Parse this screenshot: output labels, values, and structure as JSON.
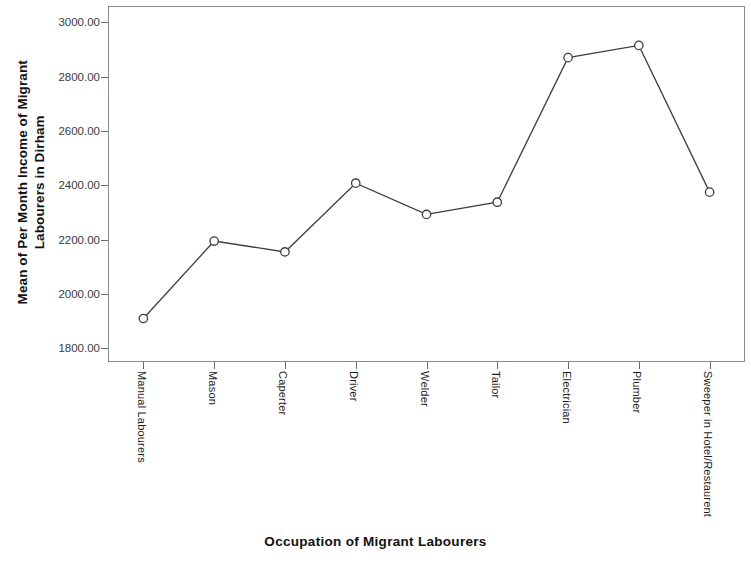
{
  "chart_data": {
    "type": "line",
    "title": "",
    "xlabel": "Occupation of Migrant Labourers",
    "ylabel": "Mean of Per Month Income of Migrant Labourers in Dirham",
    "ylabel_lines": [
      "Mean of Per Month Income of Migrant",
      "Labourers in Dirham"
    ],
    "categories": [
      "Manual Labourers",
      "Mason",
      "Caperter",
      "Driver",
      "Welder",
      "Tailor",
      "Electrician",
      "Plumber",
      "Sweeper in Hotel/Restaurent"
    ],
    "values": [
      1910,
      2195,
      2155,
      2408,
      2293,
      2338,
      2870,
      2915,
      2375
    ],
    "ylim": [
      1750,
      3060
    ],
    "yticks": [
      1800,
      2000,
      2200,
      2400,
      2600,
      2800,
      3000
    ],
    "ytick_labels": [
      "1800.00",
      "2000.00",
      "2200.00",
      "2400.00",
      "2600.00",
      "2800.00",
      "3000.00"
    ],
    "grid": false,
    "legend": false,
    "legend_position": "none",
    "marker": "open-circle",
    "line_color": "#3d3d3d",
    "marker_color": "#3d3d3d",
    "axis_color": "#8a8a8a",
    "background_color": "#ffffff"
  }
}
